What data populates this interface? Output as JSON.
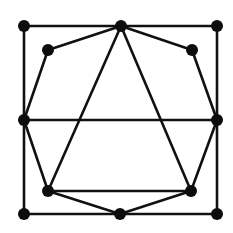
{
  "diagram": {
    "type": "graph",
    "background": "#ffffff",
    "stroke_color": "#111111",
    "node_color": "#0d0d0d",
    "stroke_width": 2.6,
    "node_radius": 6,
    "nodes": [
      {
        "id": "tl",
        "x": 24,
        "y": 26
      },
      {
        "id": "tc",
        "x": 121,
        "y": 26
      },
      {
        "id": "tr",
        "x": 217,
        "y": 26
      },
      {
        "id": "itl",
        "x": 48,
        "y": 50
      },
      {
        "id": "itr",
        "x": 192,
        "y": 50
      },
      {
        "id": "ml",
        "x": 24,
        "y": 120
      },
      {
        "id": "mr",
        "x": 217,
        "y": 120
      },
      {
        "id": "ibl",
        "x": 48,
        "y": 191
      },
      {
        "id": "ibr",
        "x": 191,
        "y": 191
      },
      {
        "id": "bl",
        "x": 24,
        "y": 214
      },
      {
        "id": "bc",
        "x": 120,
        "y": 214
      },
      {
        "id": "br",
        "x": 217,
        "y": 214
      }
    ],
    "edges": [
      [
        "tl",
        "tc"
      ],
      [
        "tc",
        "tr"
      ],
      [
        "tl",
        "ml"
      ],
      [
        "ml",
        "bl"
      ],
      [
        "tr",
        "mr"
      ],
      [
        "mr",
        "br"
      ],
      [
        "bl",
        "bc"
      ],
      [
        "bc",
        "br"
      ],
      [
        "tc",
        "itl"
      ],
      [
        "itl",
        "ml"
      ],
      [
        "tc",
        "itr"
      ],
      [
        "itr",
        "mr"
      ],
      [
        "ml",
        "ibl"
      ],
      [
        "ibl",
        "bc"
      ],
      [
        "mr",
        "ibr"
      ],
      [
        "ibr",
        "bc"
      ],
      [
        "ml",
        "mr"
      ],
      [
        "tc",
        "ibl"
      ],
      [
        "tc",
        "ibr"
      ],
      [
        "ibl",
        "ibr"
      ]
    ]
  }
}
